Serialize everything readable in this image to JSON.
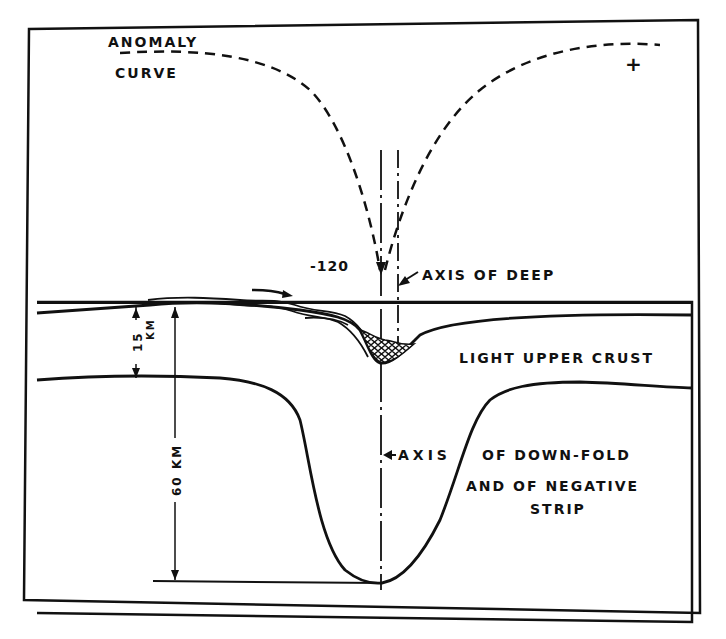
{
  "labels": {
    "anomaly_line1": "ANOMALY",
    "anomaly_line2": "CURVE",
    "plus_sign": "+",
    "minus_value": "-120",
    "axis_of_deep": "AXIS OF DEEP",
    "light_upper_crust": "LIGHT UPPER CRUST",
    "axis_downfold_line1": "AXIS",
    "axis_downfold_line2": "OF DOWN-FOLD",
    "axis_downfold_line3": "AND OF NEGATIVE",
    "axis_downfold_line4": "STRIP",
    "depth_15": "15",
    "depth_15_unit": "KM",
    "depth_60": "60 KM"
  },
  "colors": {
    "ink": "#111111",
    "paper": "#ffffff"
  }
}
